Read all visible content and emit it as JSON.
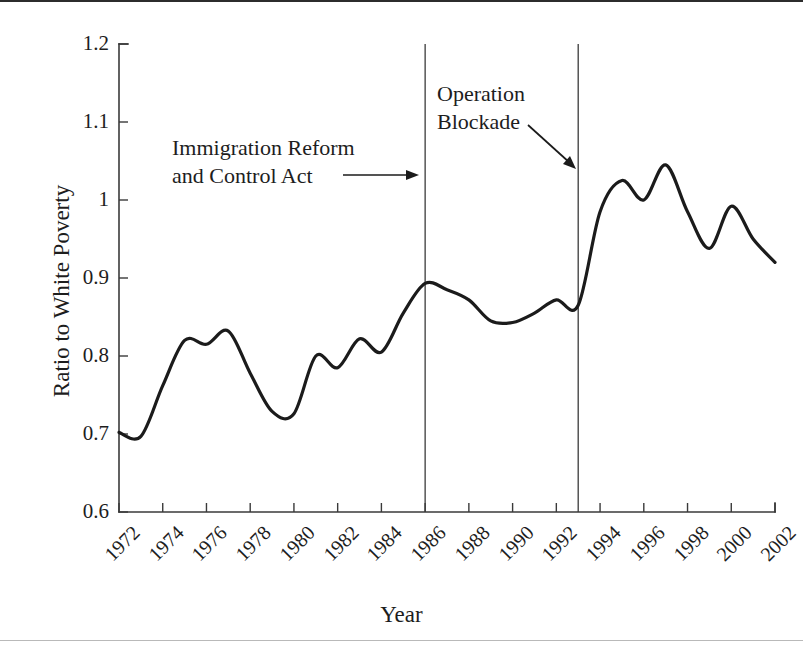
{
  "figure": {
    "background_color": "#ffffff",
    "line_color": "#1b1b1b",
    "axis_color": "#3a3a3a"
  },
  "chart_data": {
    "type": "line",
    "title": "",
    "xlabel": "Year",
    "ylabel": "Ratio to White Poverty",
    "xlim": [
      1972,
      2002
    ],
    "ylim": [
      0.6,
      1.2
    ],
    "grid": false,
    "legend": "none",
    "xticks": [
      "1972",
      "1974",
      "1976",
      "1978",
      "1980",
      "1982",
      "1984",
      "1986",
      "1988",
      "1990",
      "1992",
      "1994",
      "1996",
      "1998",
      "2000",
      "2002"
    ],
    "yticks": [
      "0.6",
      "0.7",
      "0.8",
      "0.9",
      "1",
      "1.1",
      "1.2"
    ],
    "x": [
      1972,
      1973,
      1974,
      1975,
      1976,
      1977,
      1978,
      1979,
      1980,
      1981,
      1982,
      1983,
      1984,
      1985,
      1986,
      1987,
      1988,
      1989,
      1990,
      1991,
      1992,
      1993,
      1994,
      1995,
      1996,
      1997,
      1998,
      1999,
      2000,
      2001,
      2002
    ],
    "series": [
      {
        "name": "Ratio to White Poverty",
        "values": [
          0.702,
          0.697,
          0.762,
          0.82,
          0.815,
          0.832,
          0.778,
          0.729,
          0.726,
          0.8,
          0.785,
          0.822,
          0.805,
          0.855,
          0.893,
          0.885,
          0.872,
          0.845,
          0.843,
          0.855,
          0.872,
          0.865,
          0.985,
          1.025,
          1.0,
          1.045,
          0.985,
          0.938,
          0.992,
          0.95,
          0.92
        ]
      }
    ],
    "annotations": [
      {
        "id": "immigration-reform-and-control-act",
        "text": "Immigration Reform\nand Control Act",
        "event_year": 1986,
        "arrow": "right"
      },
      {
        "id": "operation-blockade",
        "text": "Operation\nBlockade",
        "event_year": 1993,
        "arrow": "down-right"
      }
    ]
  }
}
